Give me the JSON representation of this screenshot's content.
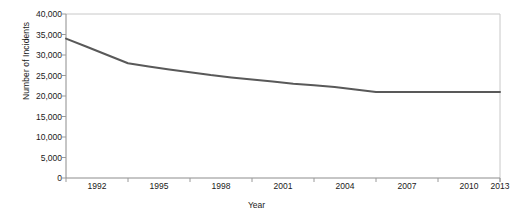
{
  "chart_data": {
    "type": "line",
    "title": "",
    "xlabel": "Year",
    "ylabel": "Number of Incidents",
    "xlim": [
      1992,
      2013
    ],
    "ylim": [
      0,
      40000
    ],
    "grid": false,
    "legend": null,
    "y_ticks": [
      40000,
      35000,
      30000,
      25000,
      20000,
      15000,
      10000,
      5000,
      0
    ],
    "y_tick_labels": [
      "40,000",
      "35,000",
      "30,000",
      "25,000",
      "20,000",
      "15,000",
      "10,000",
      "5,000",
      "0"
    ],
    "x_ticks": [
      1992,
      1995,
      1998,
      2001,
      2004,
      2007,
      2010,
      2013
    ],
    "x_tick_labels": [
      "1992",
      "1995",
      "1998",
      "2001",
      "2004",
      "2007",
      "2010",
      "2013"
    ],
    "x": [
      1992,
      1993,
      1994,
      1995,
      1996,
      1997,
      1998,
      1999,
      2000,
      2001,
      2002,
      2003,
      2004,
      2005,
      2006,
      2007,
      2008,
      2009,
      2010,
      2011,
      2012,
      2013
    ],
    "values": [
      34000,
      32000,
      30000,
      28000,
      27200,
      26500,
      25800,
      25100,
      24500,
      24000,
      23500,
      23000,
      22600,
      22200,
      21600,
      21000,
      21000,
      21000,
      21000,
      21000,
      21000,
      21000
    ],
    "series": [
      {
        "name": "Number of Incidents",
        "color": "#595959",
        "values": [
          34000,
          32000,
          30000,
          28000,
          27200,
          26500,
          25800,
          25100,
          24500,
          24000,
          23500,
          23000,
          22600,
          22200,
          21600,
          21000,
          21000,
          21000,
          21000,
          21000,
          21000,
          21000
        ]
      }
    ],
    "colors": {
      "line": "#595959",
      "axis": "#9a9a9a",
      "frame": "#c8c8c8",
      "text": "#1a1a1a",
      "background": "#ffffff"
    }
  }
}
